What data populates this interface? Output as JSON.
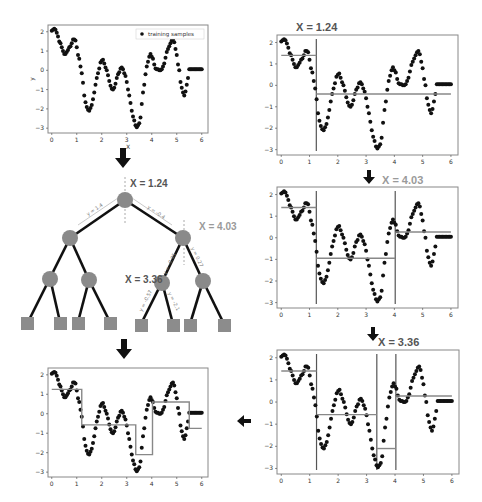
{
  "colors": {
    "point": "#111111",
    "fit_line": "#888888",
    "split_line": "#555555",
    "node": "#8a8a8a",
    "leaf": "#8c8c8c",
    "edge": "#111111",
    "title_dark": "#555555",
    "title_light": "#9a9a9a",
    "frame": "#888888"
  },
  "samples": {
    "x": [
      0.0,
      0.05,
      0.1,
      0.15,
      0.2,
      0.25,
      0.3,
      0.35,
      0.4,
      0.45,
      0.5,
      0.55,
      0.6,
      0.65,
      0.7,
      0.75,
      0.8,
      0.85,
      0.9,
      0.95,
      1.0,
      1.05,
      1.1,
      1.15,
      1.2,
      1.25,
      1.3,
      1.35,
      1.4,
      1.45,
      1.5,
      1.55,
      1.6,
      1.65,
      1.7,
      1.75,
      1.8,
      1.85,
      1.9,
      1.95,
      2.0,
      2.05,
      2.1,
      2.15,
      2.2,
      2.25,
      2.3,
      2.35,
      2.4,
      2.45,
      2.5,
      2.55,
      2.6,
      2.65,
      2.7,
      2.75,
      2.8,
      2.85,
      2.9,
      2.95,
      3.0,
      3.05,
      3.1,
      3.15,
      3.2,
      3.25,
      3.3,
      3.35,
      3.4,
      3.45,
      3.5,
      3.55,
      3.6,
      3.65,
      3.7,
      3.75,
      3.8,
      3.85,
      3.9,
      3.95,
      4.0,
      4.05,
      4.1,
      4.15,
      4.2,
      4.25,
      4.3,
      4.35,
      4.4,
      4.45,
      4.5,
      4.55,
      4.6,
      4.65,
      4.7,
      4.75,
      4.8,
      4.85,
      4.9,
      4.95,
      5.0,
      5.05,
      5.1,
      5.15,
      5.2,
      5.25,
      5.3,
      5.35,
      5.4,
      5.45,
      5.5,
      5.55,
      5.6,
      5.65,
      5.7,
      5.75,
      5.8,
      5.85,
      5.9,
      5.95,
      6.0
    ],
    "y": [
      2.05,
      2.1,
      2.15,
      2.1,
      1.95,
      1.75,
      1.5,
      1.4,
      1.2,
      1.0,
      0.85,
      0.85,
      0.95,
      1.05,
      1.2,
      1.25,
      1.4,
      1.6,
      1.6,
      1.55,
      1.2,
      0.8,
      0.6,
      0.2,
      -0.15,
      -0.65,
      -1.3,
      -1.65,
      -1.9,
      -2.05,
      -2.1,
      -1.95,
      -1.8,
      -1.5,
      -1.15,
      -0.75,
      -0.4,
      -0.15,
      0.1,
      0.4,
      0.5,
      0.55,
      0.35,
      0.15,
      0.0,
      -0.25,
      -0.55,
      -0.8,
      -0.95,
      -1.0,
      -0.9,
      -0.7,
      -0.4,
      -0.2,
      -0.1,
      0.1,
      0.15,
      0.05,
      -0.15,
      -0.3,
      -0.6,
      -1.0,
      -1.3,
      -1.7,
      -2.1,
      -2.4,
      -2.6,
      -2.85,
      -2.95,
      -2.85,
      -2.75,
      -2.45,
      -1.75,
      -1.15,
      -0.75,
      -0.2,
      0.2,
      0.45,
      0.7,
      0.85,
      0.7,
      0.6,
      0.3,
      0.1,
      0.05,
      0.05,
      0.0,
      0.0,
      0.05,
      0.2,
      0.35,
      0.65,
      0.95,
      1.1,
      1.25,
      1.4,
      1.55,
      1.6,
      1.45,
      1.1,
      0.8,
      0.3,
      0.0,
      -0.6,
      -0.9,
      -1.15,
      -1.3,
      -1.1,
      -0.75,
      -0.4,
      0.05,
      0.05,
      0.05,
      0.05,
      0.05,
      0.05,
      0.05,
      0.05,
      0.05,
      0.05,
      0.05
    ]
  },
  "panels": {
    "training": {
      "legend_label": "training samples",
      "xlabel": "X",
      "ylabel": "y",
      "x_ticks": [
        "0",
        "1",
        "2",
        "3",
        "4",
        "5",
        "6"
      ],
      "y_ticks": [
        "2",
        "1",
        "0",
        "−1",
        "−2",
        "−3"
      ]
    },
    "split1": {
      "title": "X = 1.24",
      "splits": [
        1.24
      ],
      "segments": [
        {
          "x0": 0.0,
          "x1": 1.24,
          "y": 1.4
        },
        {
          "x0": 1.24,
          "x1": 6.0,
          "y": -0.4
        }
      ]
    },
    "split2": {
      "title": "X = 4.03",
      "splits": [
        1.24,
        4.03
      ],
      "segments": [
        {
          "x0": 0.0,
          "x1": 1.24,
          "y": 1.4
        },
        {
          "x0": 1.24,
          "x1": 4.03,
          "y": -0.95
        },
        {
          "x0": 4.03,
          "x1": 6.0,
          "y": 0.27
        }
      ]
    },
    "split3": {
      "title": "X = 3.36",
      "splits": [
        1.24,
        3.36,
        4.03
      ],
      "segments": [
        {
          "x0": 0.0,
          "x1": 1.24,
          "y": 1.4
        },
        {
          "x0": 1.24,
          "x1": 3.36,
          "y": -0.57
        },
        {
          "x0": 3.36,
          "x1": 4.03,
          "y": -2.1
        },
        {
          "x0": 4.03,
          "x1": 6.0,
          "y": 0.27
        }
      ]
    },
    "final": {
      "steps": [
        [
          0.0,
          1.25
        ],
        [
          0.35,
          1.25
        ],
        [
          0.35,
          1.25
        ],
        [
          1.2,
          1.25
        ],
        [
          1.2,
          -0.57
        ],
        [
          3.36,
          -0.57
        ],
        [
          3.36,
          -2.1
        ],
        [
          4.03,
          -2.1
        ],
        [
          4.03,
          0.6
        ],
        [
          5.5,
          0.6
        ],
        [
          5.5,
          -0.75
        ],
        [
          6.0,
          -0.75
        ]
      ]
    }
  },
  "tree": {
    "root": {
      "label": "X = 1.24"
    },
    "right_split": {
      "label": "X = 4.03"
    },
    "lower_split": {
      "label": "X = 3.36"
    },
    "edge_labels": {
      "root_left": "y = 1.4",
      "root_right": "y = -0.4",
      "right_left": "y = -0.95",
      "right_right": "y = 0.27",
      "lower_left": "y = -0.57",
      "lower_right": "y = -2.1"
    }
  },
  "chart_data": [
    {
      "type": "scatter",
      "title": "",
      "xlabel": "X",
      "ylabel": "y",
      "xlim": [
        0,
        6
      ],
      "ylim": [
        -3,
        2.2
      ],
      "legend": [
        "training samples"
      ],
      "legend_position": "upper right",
      "series": [
        {
          "name": "training samples",
          "description": "noisy sinusoidal samples, peaks ~2.1 at x=0.1, ~1.6 at x=0.95, ~0.55 at x=2.05, ~0.15 at x=2.95, ~0.85 at x=4.25, ~1.6 at x=5.2; troughs ~-2.1 at x=1.5, ~-1.0 at x=2.7, ~-2.95 at x=3.65, ~-1.3 at x=5.8"
        }
      ]
    },
    {
      "type": "line",
      "title": "X = 1.24",
      "splits": [
        1.24
      ],
      "leaf_values": [
        1.4,
        -0.4
      ]
    },
    {
      "type": "line",
      "title": "X = 4.03",
      "splits": [
        1.24,
        4.03
      ],
      "leaf_values": [
        1.4,
        -0.95,
        0.27
      ]
    },
    {
      "type": "line",
      "title": "X = 3.36",
      "splits": [
        1.24,
        3.36,
        4.03
      ],
      "leaf_values": [
        1.4,
        -0.57,
        -2.1,
        0.27
      ]
    },
    {
      "type": "line",
      "title": "",
      "description": "final regression tree step-function fit over training samples"
    }
  ]
}
